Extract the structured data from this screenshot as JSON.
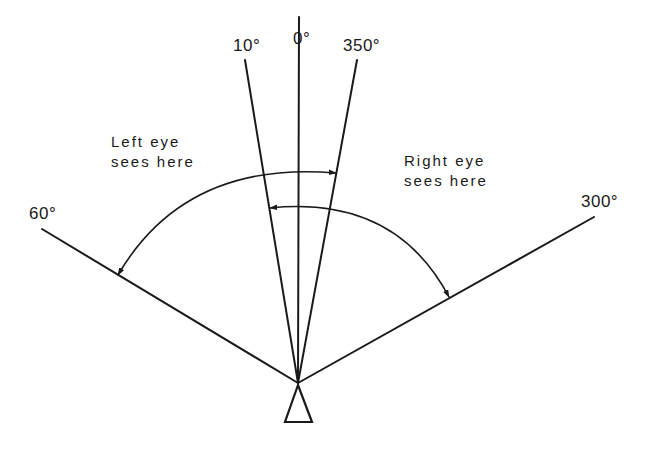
{
  "diagram": {
    "title": "",
    "angle_labels": {
      "deg10": "10°",
      "deg0": "0°",
      "deg350": "350°",
      "deg60": "60°",
      "deg300": "300°"
    },
    "annotations": {
      "left_eye_line1": "Left eye",
      "left_eye_line2": "sees here",
      "right_eye_line1": "Right eye",
      "right_eye_line2": "sees here"
    },
    "observer": "triangle-viewer",
    "rays": [
      {
        "angle": "60°",
        "from": [
          298,
          383
        ],
        "to": [
          42,
          229
        ]
      },
      {
        "angle": "10°",
        "from": [
          298,
          383
        ],
        "to": [
          245,
          60
        ]
      },
      {
        "angle": "0°",
        "from": [
          298,
          383
        ],
        "to": [
          299,
          17
        ]
      },
      {
        "angle": "350°",
        "from": [
          298,
          383
        ],
        "to": [
          357,
          60
        ]
      },
      {
        "angle": "300°",
        "from": [
          298,
          383
        ],
        "to": [
          594,
          217
        ]
      }
    ],
    "arcs": [
      {
        "name": "left-eye-field",
        "span": "60° to 350°"
      },
      {
        "name": "right-eye-field",
        "span": "10° to 300°"
      }
    ],
    "stroke_color": "#1a1a1a"
  }
}
